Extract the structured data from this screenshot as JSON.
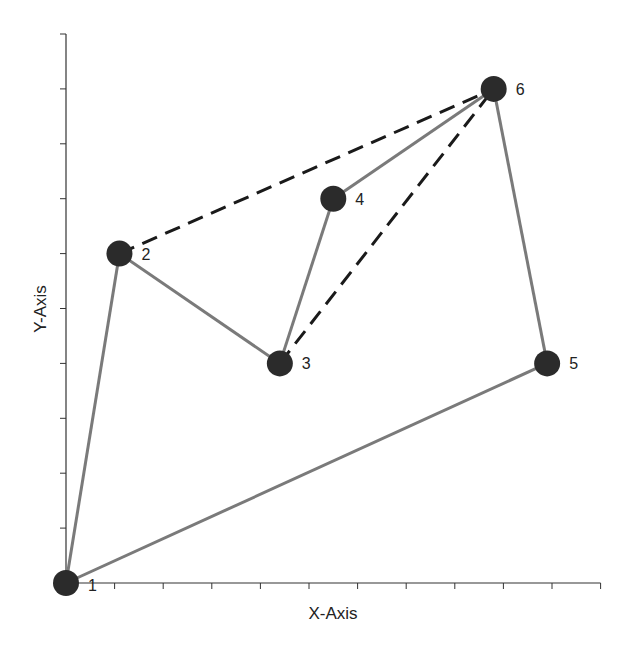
{
  "chart_data": {
    "type": "scatter",
    "title": "",
    "xlabel": "X-Axis",
    "ylabel": "Y-Axis",
    "xlim": [
      0,
      11
    ],
    "ylim": [
      0,
      10
    ],
    "x_ticks": 11,
    "y_ticks": 10,
    "tick_labels_shown": false,
    "grid": false,
    "nodes": [
      {
        "id": "1",
        "x": 0.0,
        "y": 0.0
      },
      {
        "id": "2",
        "x": 1.1,
        "y": 6.0
      },
      {
        "id": "3",
        "x": 4.4,
        "y": 4.0
      },
      {
        "id": "4",
        "x": 5.5,
        "y": 7.0
      },
      {
        "id": "5",
        "x": 9.9,
        "y": 4.0
      },
      {
        "id": "6",
        "x": 8.8,
        "y": 9.0
      }
    ],
    "solid_edges": [
      [
        "1",
        "2"
      ],
      [
        "2",
        "3"
      ],
      [
        "3",
        "4"
      ],
      [
        "4",
        "6"
      ],
      [
        "6",
        "5"
      ],
      [
        "5",
        "1"
      ]
    ],
    "dashed_edges": [
      [
        "2",
        "6"
      ],
      [
        "3",
        "6"
      ]
    ],
    "colors": {
      "solid_edge": "#7a7a7a",
      "dashed_edge": "#1a1a1a",
      "node": "#2b2b2b",
      "axis": "#333333"
    }
  }
}
